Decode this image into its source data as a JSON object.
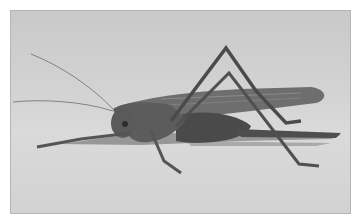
{
  "image": {
    "subject": "grasshopper",
    "description": "Grayscale side-view photograph of a long-horned grasshopper (katydid) standing on a pale surface",
    "colors": {
      "border": "#ffffff",
      "background": "#d2d2d2",
      "insect_body": "#5e5e5e",
      "insect_dark": "#3a3a3a",
      "shadow": "#6a6a6a"
    }
  }
}
